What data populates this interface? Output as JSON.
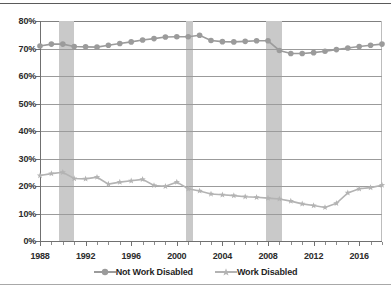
{
  "chart_data": {
    "type": "line",
    "title": "",
    "xlabel": "",
    "ylabel": "",
    "xlim": [
      1988,
      2018
    ],
    "ylim": [
      0,
      80
    ],
    "y_tick_suffix": "%",
    "y_ticks": [
      0,
      10,
      20,
      30,
      40,
      50,
      60,
      70,
      80
    ],
    "y_tick_labels": [
      "0%",
      "10%",
      "20%",
      "30%",
      "40%",
      "50%",
      "60%",
      "70%",
      "80%"
    ],
    "x_ticks": [
      1988,
      1992,
      1996,
      2000,
      2004,
      2008,
      2012,
      2016
    ],
    "x_tick_labels": [
      "1988",
      "1992",
      "1996",
      "2000",
      "2004",
      "2008",
      "2012",
      "2016"
    ],
    "x": [
      1988,
      1989,
      1990,
      1991,
      1992,
      1993,
      1994,
      1995,
      1996,
      1997,
      1998,
      1999,
      2000,
      2001,
      2002,
      2003,
      2004,
      2005,
      2006,
      2007,
      2008,
      2009,
      2010,
      2011,
      2012,
      2013,
      2014,
      2015,
      2016,
      2017,
      2018
    ],
    "grid": "horizontal",
    "legend_position": "bottom",
    "series": [
      {
        "name": "Not Work Disabled",
        "color": "#9b9b9b",
        "marker": "circle",
        "values": [
          70.9,
          71.6,
          71.6,
          70.7,
          70.6,
          70.5,
          71.2,
          71.8,
          72.4,
          73.1,
          73.6,
          74.2,
          74.3,
          74.3,
          74.8,
          72.9,
          72.5,
          72.4,
          72.6,
          72.8,
          72.8,
          69.3,
          68.2,
          68.2,
          68.5,
          69.0,
          69.6,
          70.2,
          70.7,
          71.2,
          71.6
        ]
      },
      {
        "name": "Work Disabled",
        "color": "#b3b3b3",
        "marker": "star",
        "values": [
          23.8,
          24.5,
          25.0,
          22.7,
          22.6,
          23.2,
          20.7,
          21.4,
          21.9,
          22.4,
          20.2,
          19.9,
          21.4,
          19.0,
          18.2,
          17.1,
          16.8,
          16.5,
          16.1,
          15.9,
          15.6,
          15.3,
          14.5,
          13.5,
          12.9,
          12.2,
          13.7,
          17.5,
          19.0,
          19.4,
          20.3
        ]
      }
    ],
    "shaded_bands": [
      {
        "name": "recession-1990",
        "start": 1989.7,
        "end": 1991.0
      },
      {
        "name": "recession-2001",
        "start": 2000.8,
        "end": 2001.4
      },
      {
        "name": "recession-2008",
        "start": 2007.8,
        "end": 2009.2
      }
    ]
  }
}
